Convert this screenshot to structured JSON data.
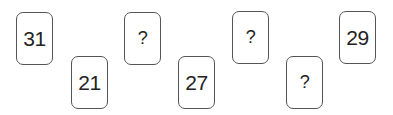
{
  "puzzle": {
    "cards": [
      {
        "value": "31",
        "position": "top"
      },
      {
        "value": "21",
        "position": "bottom"
      },
      {
        "value": "?",
        "position": "top"
      },
      {
        "value": "27",
        "position": "bottom"
      },
      {
        "value": "?",
        "position": "top"
      },
      {
        "value": "?",
        "position": "bottom"
      },
      {
        "value": "29",
        "position": "top"
      }
    ]
  }
}
